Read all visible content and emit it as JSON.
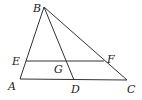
{
  "diagram": {
    "type": "geometry",
    "stroke_color": "#333333",
    "points": {
      "A": {
        "label": "A",
        "x": 20,
        "y": 79,
        "lx": 8,
        "ly": 90
      },
      "B": {
        "label": "B",
        "x": 44,
        "y": 7,
        "lx": 33,
        "ly": 12
      },
      "C": {
        "label": "C",
        "x": 127,
        "y": 80,
        "lx": 127,
        "ly": 93
      },
      "D": {
        "label": "D",
        "x": 74,
        "y": 80,
        "lx": 71,
        "ly": 93
      },
      "E": {
        "label": "E",
        "x": 26,
        "y": 61,
        "lx": 12,
        "ly": 65
      },
      "F": {
        "label": "F",
        "x": 104,
        "y": 61,
        "lx": 107,
        "ly": 63
      },
      "G": {
        "label": "G",
        "x": 68,
        "y": 61,
        "lx": 54,
        "ly": 73
      }
    },
    "segments": [
      [
        "A",
        "B"
      ],
      [
        "B",
        "C"
      ],
      [
        "A",
        "C"
      ],
      [
        "B",
        "D"
      ],
      [
        "E",
        "F"
      ]
    ]
  }
}
